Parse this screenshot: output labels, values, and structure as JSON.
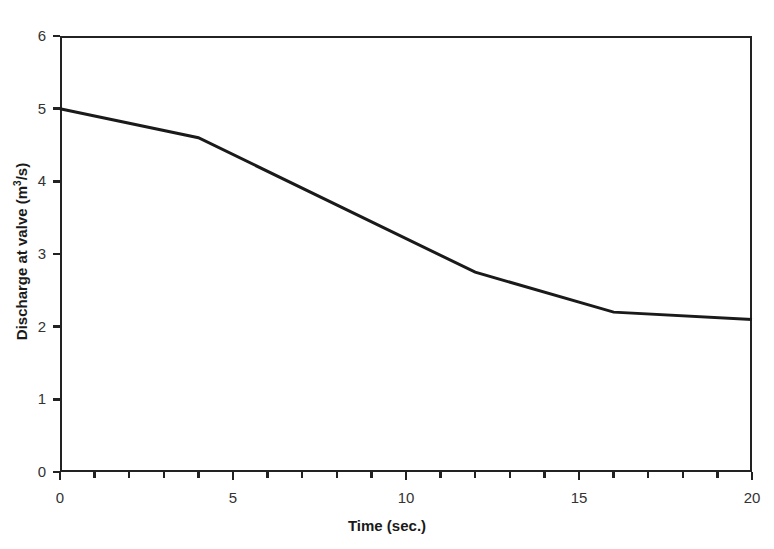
{
  "chart_data": {
    "type": "line",
    "title": "",
    "xlabel": "Time (sec.)",
    "ylabel_prefix": "Discharge at valve (m",
    "ylabel_sup": "3",
    "ylabel_suffix": "/s)",
    "ylabel_plain": "Discharge at valve (m3/s)",
    "x": [
      0,
      4,
      12,
      16,
      20
    ],
    "values": [
      5.0,
      4.6,
      2.75,
      2.2,
      2.1
    ],
    "series": [
      {
        "name": "Discharge at valve",
        "points": [
          {
            "x": 0,
            "y": 5.0
          },
          {
            "x": 4,
            "y": 4.6
          },
          {
            "x": 12,
            "y": 2.75
          },
          {
            "x": 16,
            "y": 2.2
          },
          {
            "x": 20,
            "y": 2.1
          }
        ]
      }
    ],
    "xlim": [
      0,
      20
    ],
    "ylim": [
      0,
      6
    ],
    "xticks": [
      0,
      5,
      10,
      15,
      20
    ],
    "xtick_labels": [
      "0",
      "5",
      "10",
      "15",
      "20"
    ],
    "xminor_step": 1,
    "yticks": [
      0,
      1,
      2,
      3,
      4,
      5,
      6
    ],
    "ytick_labels": [
      "0",
      "1",
      "2",
      "3",
      "4",
      "5",
      "6"
    ],
    "grid": false,
    "legend": false,
    "line_color": "#1a1a1a",
    "line_width": 3,
    "background": "#ffffff",
    "frame_color": "#222222"
  }
}
